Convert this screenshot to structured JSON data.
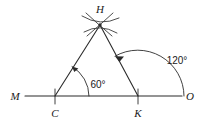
{
  "figure": {
    "type": "geometry-construction-diagram",
    "background_color": "#ffffff",
    "ink_color": "#2b2b2b"
  },
  "points": {
    "M": {
      "label": "M",
      "x": 15,
      "y": 96,
      "role": "line-endpoint-left"
    },
    "O": {
      "label": "O",
      "x": 189,
      "y": 96,
      "role": "line-endpoint-right"
    },
    "C": {
      "label": "C",
      "x": 55,
      "y": 96,
      "role": "base-vertex-left",
      "label_x": 55,
      "label_y": 114
    },
    "K": {
      "label": "K",
      "x": 138,
      "y": 96,
      "role": "base-vertex-right",
      "label_x": 138,
      "label_y": 114
    },
    "H": {
      "label": "H",
      "x": 100,
      "y": 25,
      "role": "apex",
      "label_x": 100,
      "label_y": 12
    }
  },
  "segments": [
    {
      "name": "baseline-MO",
      "from": "M",
      "to": "O"
    },
    {
      "name": "side-CH",
      "from": "C",
      "to": "H"
    },
    {
      "name": "side-KH",
      "from": "K",
      "to": "H"
    }
  ],
  "tick_marks": [
    {
      "name": "tick-at-C",
      "at": "C"
    },
    {
      "name": "tick-at-K",
      "at": "K"
    }
  ],
  "angles": [
    {
      "name": "angle-HCK",
      "value": "60",
      "unit": "°",
      "text": "60°",
      "vertex": "C",
      "text_x": 98,
      "text_y": 88,
      "arc_radius": 34,
      "from_deg": 0,
      "to_deg": 60,
      "arrow_at": "terminal-side"
    },
    {
      "name": "angle-HKO",
      "value": "120",
      "unit": "°",
      "text": "120°",
      "vertex": "K",
      "text_x": 177,
      "text_y": 64,
      "arc_radius": 46,
      "from_deg": 0,
      "to_deg": 120,
      "arrow_at": "terminal-side"
    }
  ],
  "construction_marks": {
    "name": "compass-arc-intersection-at-H",
    "count": 2,
    "note": "two crossing compass arcs meeting at apex H"
  }
}
